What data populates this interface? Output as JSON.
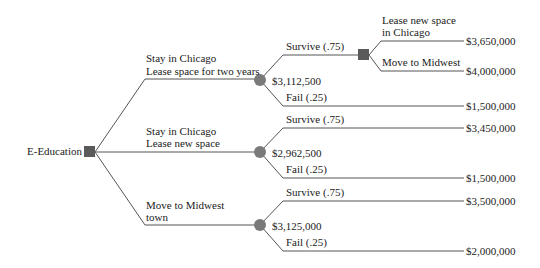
{
  "diagram": {
    "type": "decision-tree",
    "root": {
      "label": "E-Education",
      "node_type": "decision"
    },
    "branches": [
      {
        "label_line1": "Stay in Chicago",
        "label_line2": "Lease space for two years",
        "chance_node_value": "$3,112,500",
        "outcomes": [
          {
            "label": "Survive (.75)",
            "decision": {
              "options": [
                {
                  "label_line1": "Lease new space",
                  "label_line2": "in Chicago",
                  "payoff": "$3,650,000"
                },
                {
                  "label_line1": "Move to Midwest",
                  "label_line2": "",
                  "payoff": "$4,000,000"
                }
              ]
            }
          },
          {
            "label": "Fail (.25)",
            "payoff": "$1,500,000"
          }
        ]
      },
      {
        "label_line1": "Stay in Chicago",
        "label_line2": "Lease new space",
        "chance_node_value": "$2,962,500",
        "outcomes": [
          {
            "label": "Survive (.75)",
            "payoff": "$3,450,000"
          },
          {
            "label": "Fail (.25)",
            "payoff": "$1,500,000"
          }
        ]
      },
      {
        "label_line1": "Move to Midwest",
        "label_line2": "town",
        "chance_node_value": "$3,125,000",
        "outcomes": [
          {
            "label": "Survive (.75)",
            "payoff": "$3,500,000"
          },
          {
            "label": "Fail (.25)",
            "payoff": "$2,000,000"
          }
        ]
      }
    ],
    "colors": {
      "line": "#555555",
      "decision_node": "#5a5a5a",
      "chance_node": "#7a7a7a",
      "text": "#222222",
      "background": "#ffffff"
    }
  }
}
